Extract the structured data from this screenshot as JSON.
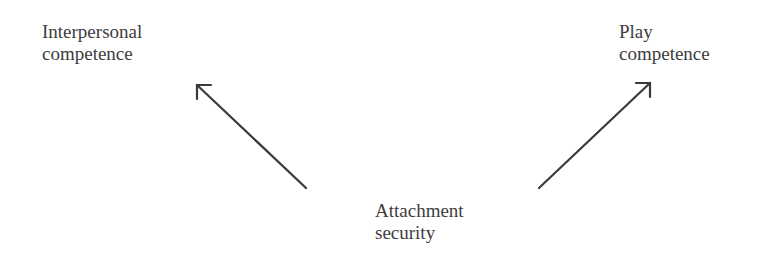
{
  "diagram": {
    "nodes": [
      {
        "id": "interpersonal",
        "lines": [
          "Interpersonal",
          "competence"
        ]
      },
      {
        "id": "play",
        "lines": [
          "Play",
          "competence"
        ]
      },
      {
        "id": "attachment",
        "lines": [
          "Attachment",
          "security"
        ]
      }
    ],
    "edges": [
      {
        "from": "attachment",
        "to": "interpersonal"
      },
      {
        "from": "attachment",
        "to": "play"
      }
    ],
    "colors": {
      "line": "#3a3a3a",
      "text": "#3d3d3d",
      "background": "#ffffff"
    }
  }
}
